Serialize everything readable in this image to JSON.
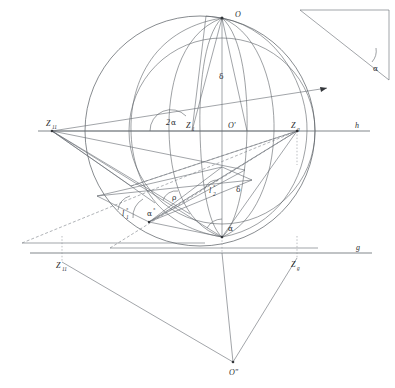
{
  "figure": {
    "background_color": "#ffffff",
    "line_color": "#555a60",
    "label_color": "#2a2d31"
  },
  "labels": {
    "point_O": "O",
    "point_O_prime": "O'",
    "point_O_double_prime": "Oʺ",
    "point_Z1": "Z",
    "point_Z1_sub": "1",
    "point_Z11_upper": "Z",
    "point_Z11_upper_sub": "11",
    "point_Zg_upper": "Z",
    "point_Zg_upper_sub": "g",
    "point_Z11_lower": "Z",
    "point_Z11_lower_sub": "11",
    "point_Zg_lower": "Z",
    "point_Zg_lower_sub": "g",
    "line_h": "h",
    "line_g": "g",
    "angle_two_alpha_num": "2",
    "angle_two_alpha_greek": "α",
    "angle_alpha": "α",
    "angle_alpha_inset": "α",
    "angle_alpha_deg": "α",
    "angle_alpha_deg_sup": "°",
    "delta_upper": "δ",
    "delta_lower": "δ",
    "rho": "ρ",
    "arc_l1": "l",
    "arc_l1_sub": "1",
    "arc_l1_sup": "°",
    "arc_l2": "l",
    "arc_l2_sub": "2",
    "arc_l2_sup": "°"
  },
  "geometry": {
    "sphere_center_x": 200,
    "sphere_center_y": 131,
    "sphere_radius": 115,
    "horizon_line_h_y": 131,
    "ground_line_g_y": 253,
    "pole_top_x": 222,
    "pole_top_y": 18,
    "pole_bottom_x": 222,
    "pole_bottom_y": 237,
    "apex_O_double_prime_x": 233,
    "apex_O_double_prime_y": 362
  },
  "inset": {
    "name": "right-triangle-inset",
    "apex_top_left_x": 300,
    "apex_top_right_x": 389,
    "apex_top_y": 10,
    "apex_bottom_y": 80
  }
}
